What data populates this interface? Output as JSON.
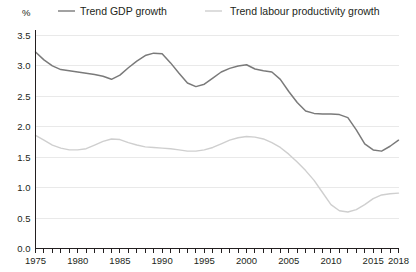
{
  "chart_data": {
    "type": "line",
    "title": "",
    "subtitle": "",
    "unit_label": "%",
    "xlabel": "",
    "ylabel": "",
    "xlim": [
      1975,
      2018
    ],
    "ylim": [
      0.0,
      3.5
    ],
    "grid": true,
    "legend_position": "top",
    "y_ticks": [
      "0.0",
      "0.5",
      "1.0",
      "1.5",
      "2.0",
      "2.5",
      "3.0",
      "3.5"
    ],
    "y_tick_values": [
      0.0,
      0.5,
      1.0,
      1.5,
      2.0,
      2.5,
      3.0,
      3.5
    ],
    "x_ticks_labeled": [
      "1975",
      "1980",
      "1985",
      "1990",
      "1995",
      "2000",
      "2005",
      "2010",
      "2015",
      "2018"
    ],
    "x_tick_values": [
      1975,
      1980,
      1985,
      1990,
      1995,
      2000,
      2005,
      2010,
      2015,
      2018
    ],
    "x_minor_tick_step": 1,
    "x": [
      1975,
      1976,
      1977,
      1978,
      1979,
      1980,
      1981,
      1982,
      1983,
      1984,
      1985,
      1986,
      1987,
      1988,
      1989,
      1990,
      1991,
      1992,
      1993,
      1994,
      1995,
      1996,
      1997,
      1998,
      1999,
      2000,
      2001,
      2002,
      2003,
      2004,
      2005,
      2006,
      2007,
      2008,
      2009,
      2010,
      2011,
      2012,
      2013,
      2014,
      2015,
      2016,
      2017,
      2018
    ],
    "series": [
      {
        "name": "Trend GDP growth",
        "color": "#7a7a7a",
        "values": [
          3.23,
          3.1,
          3.0,
          2.94,
          2.92,
          2.9,
          2.88,
          2.86,
          2.83,
          2.78,
          2.85,
          2.97,
          3.08,
          3.17,
          3.21,
          3.2,
          3.05,
          2.88,
          2.72,
          2.66,
          2.7,
          2.8,
          2.9,
          2.96,
          3.0,
          3.02,
          2.95,
          2.92,
          2.9,
          2.78,
          2.58,
          2.4,
          2.26,
          2.22,
          2.21,
          2.21,
          2.2,
          2.15,
          1.95,
          1.72,
          1.62,
          1.6,
          1.68,
          1.78
        ]
      },
      {
        "name": "Trend labour productivity growth",
        "color": "#cfcfcf",
        "values": [
          1.86,
          1.78,
          1.7,
          1.65,
          1.62,
          1.62,
          1.64,
          1.7,
          1.76,
          1.8,
          1.79,
          1.74,
          1.7,
          1.67,
          1.66,
          1.65,
          1.64,
          1.62,
          1.6,
          1.6,
          1.62,
          1.66,
          1.72,
          1.78,
          1.82,
          1.84,
          1.83,
          1.8,
          1.74,
          1.66,
          1.55,
          1.42,
          1.28,
          1.12,
          0.92,
          0.72,
          0.62,
          0.6,
          0.64,
          0.72,
          0.82,
          0.88,
          0.9,
          0.91
        ]
      }
    ],
    "tail_values": {
      "gdp_last": 1.92,
      "productivity_last": 0.92
    },
    "annotations": []
  },
  "legend": {
    "items": [
      {
        "label": "Trend GDP growth",
        "color": "#7a7a7a"
      },
      {
        "label": "Trend labour productivity growth",
        "color": "#cfcfcf"
      }
    ]
  }
}
